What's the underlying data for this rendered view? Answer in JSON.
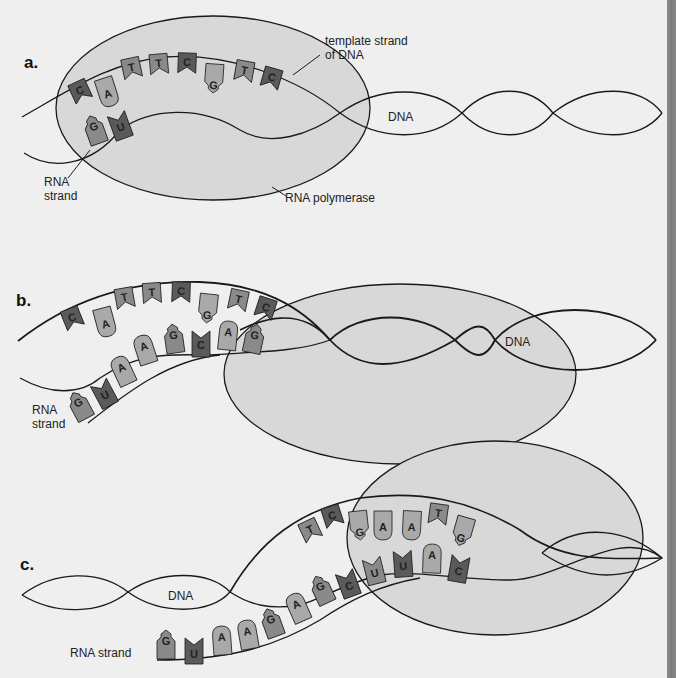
{
  "colors": {
    "background": "#efefef",
    "polymerase_fill": "#d8d8d8",
    "stroke": "#1a1a1a",
    "nucleotide_dark": "#5a5a5a",
    "nucleotide_mid": "#8a8a8a",
    "nucleotide_light": "#a9a9a9",
    "edge_strip": "#808080"
  },
  "panels": {
    "a": {
      "label": "a.",
      "callouts": {
        "template_strand_line1": "template strand",
        "template_strand_line2": "of DNA",
        "dna": "DNA",
        "rna_strand_line1": "RNA",
        "rna_strand_line2": "strand",
        "rna_polymerase": "RNA polymerase"
      },
      "template_bases": [
        "C",
        "A",
        "T",
        "T",
        "C",
        "G",
        "T",
        "C"
      ],
      "rna_bases": [
        "G",
        "U"
      ]
    },
    "b": {
      "label": "b.",
      "callouts": {
        "dna": "DNA",
        "rna_strand_line1": "RNA",
        "rna_strand_line2": "strand"
      },
      "template_bases": [
        "C",
        "A",
        "T",
        "T",
        "C",
        "G",
        "T",
        "C"
      ],
      "rna_bases": [
        "G",
        "U",
        "A",
        "A",
        "G",
        "C",
        "A",
        "G"
      ]
    },
    "c": {
      "label": "c.",
      "callouts": {
        "dna": "DNA",
        "rna_strand": "RNA strand"
      },
      "template_bases": [
        "T",
        "C",
        "G",
        "A",
        "A",
        "T",
        "G"
      ],
      "rna_bases": [
        "G",
        "U",
        "A",
        "A",
        "G",
        "A",
        "G",
        "C",
        "U",
        "U",
        "A",
        "C"
      ]
    }
  }
}
